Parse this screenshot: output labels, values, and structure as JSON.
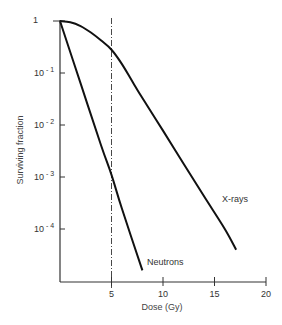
{
  "chart_data": {
    "type": "line",
    "title": "",
    "xlabel": "Dose (Gy)",
    "ylabel": "Surviving fraction",
    "xlim": [
      0,
      20
    ],
    "ylim_log10": [
      -5.0,
      0
    ],
    "yscale": "log",
    "grid": false,
    "legend": "none (inline labels)",
    "x_ticks": [
      5,
      10,
      15,
      20
    ],
    "x_tick_labels": [
      "5",
      "10",
      "15",
      "20"
    ],
    "y_ticks": [
      1,
      0.1,
      0.01,
      0.001,
      0.0001
    ],
    "y_tick_labels": [
      {
        "base": "1",
        "exp": ""
      },
      {
        "base": "10",
        "exp": "- 1"
      },
      {
        "base": "10",
        "exp": "- 2"
      },
      {
        "base": "10",
        "exp": "- 3"
      },
      {
        "base": "10",
        "exp": "- 4"
      }
    ],
    "series": [
      {
        "name": "X-rays",
        "label": "X-rays",
        "shape": "shouldered curve then straight exponential",
        "points": [
          {
            "x": 0,
            "y": 1.0
          },
          {
            "x": 1,
            "y": 0.95
          },
          {
            "x": 2,
            "y": 0.8
          },
          {
            "x": 3,
            "y": 0.6
          },
          {
            "x": 4,
            "y": 0.42
          },
          {
            "x": 5,
            "y": 0.28
          },
          {
            "x": 6,
            "y": 0.15
          },
          {
            "x": 7,
            "y": 0.07
          },
          {
            "x": 8,
            "y": 0.033
          },
          {
            "x": 10,
            "y": 0.0078
          },
          {
            "x": 12,
            "y": 0.0018
          },
          {
            "x": 14,
            "y": 0.00042
          },
          {
            "x": 16,
            "y": 0.0001
          },
          {
            "x": 17.1,
            "y": 4e-05
          }
        ]
      },
      {
        "name": "Neutrons",
        "label": "Neutrons",
        "shape": "straight exponential, no shoulder",
        "points": [
          {
            "x": 0,
            "y": 1.0
          },
          {
            "x": 2,
            "y": 0.063
          },
          {
            "x": 4,
            "y": 0.004
          },
          {
            "x": 5,
            "y": 0.0011
          },
          {
            "x": 6,
            "y": 0.00025
          },
          {
            "x": 8,
            "y": 1.6e-05
          }
        ]
      }
    ],
    "annotations": [
      {
        "type": "vertical dash-dot line",
        "x": 5
      }
    ]
  },
  "colors": {
    "curve": "#111111",
    "axis": "#333333",
    "text": "#333333",
    "background": "#ffffff"
  }
}
